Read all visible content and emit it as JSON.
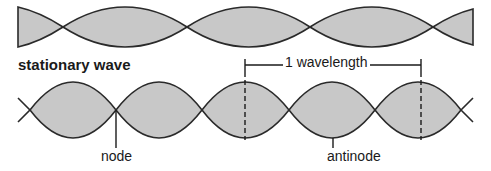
{
  "diagram": {
    "title": "stationary wave",
    "labels": {
      "wavelength": "1 wavelength",
      "node": "node",
      "antinode": "antinode"
    },
    "colors": {
      "fill": "#c8c8c8",
      "line": "#2a2a2a",
      "background": "#ffffff"
    },
    "top_wave": {
      "center_y": 27,
      "amplitude": 20,
      "node_x": [
        63,
        187,
        310,
        433
      ],
      "x_start": 18,
      "x_end": 473
    },
    "bottom_wave": {
      "center_y": 110,
      "amplitude": 28,
      "node_x": [
        30,
        116,
        202,
        289,
        375,
        461
      ],
      "x_start": 18,
      "x_end": 473
    },
    "wavelength_marker": {
      "x_start": 245,
      "x_end": 421,
      "y": 65
    }
  }
}
